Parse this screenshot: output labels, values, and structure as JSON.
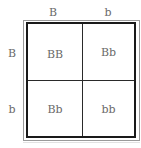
{
  "diagram": {
    "type": "punnett-square",
    "column_headers": [
      "B",
      "b"
    ],
    "row_headers": [
      "B",
      "b"
    ],
    "cells": [
      [
        "BB",
        "Bb"
      ],
      [
        "Bb",
        "bb"
      ]
    ]
  },
  "colors": {
    "text": "#6a6a6a",
    "frame_inner": "#1a1a1a",
    "frame_outer": "#9a9a9a",
    "grid_line": "#2a2a2a",
    "background": "#ffffff"
  }
}
